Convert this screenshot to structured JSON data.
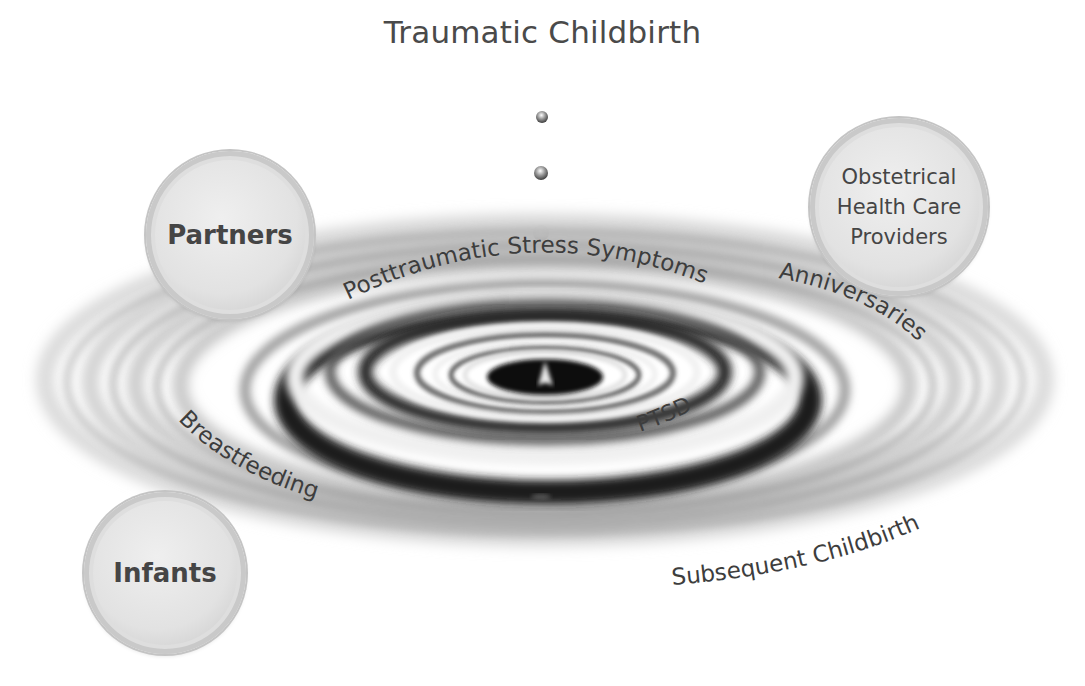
{
  "diagram": {
    "title": "Traumatic Childbirth",
    "drops": [
      {
        "icon": "water-drop-icon",
        "cx": 542,
        "cy": 117,
        "r": 6
      },
      {
        "icon": "water-drop-icon",
        "cx": 541,
        "cy": 173,
        "r": 7
      },
      {
        "icon": "water-drop-icon",
        "cx": 541,
        "cy": 233,
        "r": 8
      }
    ],
    "ripple_labels": {
      "posttraumatic": "Posttraumatic Stress Symptoms",
      "ptsd": "PTSD",
      "anniversaries": "Anniversaries",
      "breastfeeding": "Breastfeeding",
      "subsequent": "Subsequent Childbirth"
    },
    "bubbles": {
      "partners": {
        "label": "Partners"
      },
      "obstetrical": {
        "lines": [
          "Obstetrical",
          "Health Care",
          "Providers"
        ]
      },
      "infants": {
        "label": "Infants"
      }
    },
    "colors": {
      "text": "#3d3d3d",
      "ripple_dark": "#1a1a1a",
      "ripple_light": "#f4f4f4",
      "bubble_fill": "#e4e4e4",
      "bubble_ring": "#c2c2c2"
    }
  }
}
